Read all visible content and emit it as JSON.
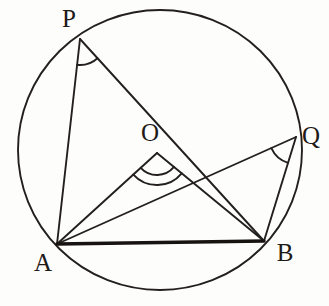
{
  "figure": {
    "background_color": "#fdfdfb",
    "stroke_color": "#221f1c",
    "chord_color": "#171310"
  },
  "circle": {
    "center_x": 160,
    "center_y": 150,
    "radius_x": 142,
    "radius_y": 140,
    "stroke_width": 1.9
  },
  "points": {
    "P": {
      "label": "P",
      "x": 80,
      "y": 39,
      "label_x": 69,
      "label_y": 21
    },
    "Q": {
      "label": "Q",
      "x": 296,
      "y": 137,
      "label_x": 311,
      "label_y": 138
    },
    "A": {
      "label": "A",
      "x": 57,
      "y": 244,
      "label_x": 43,
      "label_y": 265
    },
    "B": {
      "label": "B",
      "x": 264,
      "y": 241,
      "label_x": 285,
      "label_y": 255
    },
    "O": {
      "label": "O",
      "x": 157,
      "y": 153,
      "label_x": 150,
      "label_y": 135
    }
  },
  "segments": [
    {
      "name": "segment-PA",
      "from": "P",
      "to": "A",
      "width": 1.9
    },
    {
      "name": "segment-PB",
      "from": "P",
      "to": "B",
      "width": 1.9
    },
    {
      "name": "segment-QA",
      "from": "Q",
      "to": "A",
      "width": 1.9
    },
    {
      "name": "segment-QB",
      "from": "Q",
      "to": "B",
      "width": 1.9
    },
    {
      "name": "segment-OA",
      "from": "O",
      "to": "A",
      "width": 1.9
    },
    {
      "name": "segment-OB",
      "from": "O",
      "to": "B",
      "width": 1.9
    },
    {
      "name": "segment-AB",
      "from": "A",
      "to": "B",
      "width": 3.4
    }
  ],
  "angle_marks": [
    {
      "name": "angle-arc-at-P",
      "vertex": "P",
      "arcs": 1,
      "radius": 26
    },
    {
      "name": "angle-arc-at-Q",
      "vertex": "Q",
      "arcs": 1,
      "radius": 27
    },
    {
      "name": "angle-arc-at-O",
      "vertex": "O",
      "arcs": 2,
      "radius_inner": 22,
      "radius_outer": 32
    }
  ]
}
